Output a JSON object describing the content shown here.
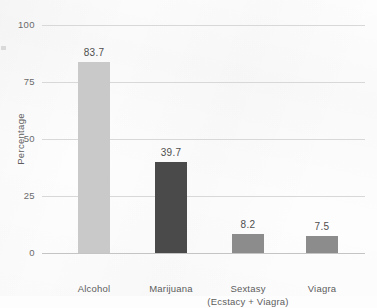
{
  "chart_data": {
    "type": "bar",
    "title": "",
    "subtitle": "",
    "xlabel": "",
    "ylabel": "Percentage",
    "ylim": [
      0,
      100
    ],
    "yticks": [
      "0",
      "25",
      "50",
      "75",
      "100"
    ],
    "grid": true,
    "legend": "none",
    "categories": [
      "Alcohol",
      "Marijuana",
      "Sextasy",
      "Viagra"
    ],
    "category_sublabels": [
      "",
      "",
      "(Ecstacy + Viagra)",
      ""
    ],
    "values": [
      83.7,
      39.7,
      8.2,
      7.5
    ],
    "value_labels": [
      "83.7",
      "39.7",
      "8.2",
      "7.5"
    ],
    "bar_colors": [
      "#c9c9c9",
      "#4a4a4a",
      "#8c8c8c",
      "#8c8c8c"
    ]
  },
  "style": {
    "background": "#fdfdfd",
    "gridline_color": "#d8d8d8",
    "axis_color": "#c4c4c4",
    "text_color": "#5d5d5d"
  }
}
